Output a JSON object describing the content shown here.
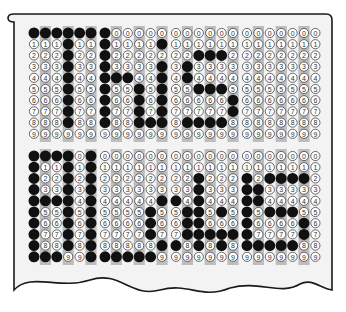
{
  "sheet": {
    "title": "Scantron answer sheet drawing",
    "paper_color": "#f3f3f3",
    "stripe_color": "#bdbdbd",
    "fill_color": "#111111",
    "bubble_stroke": "#444444",
    "groups": [
      6,
      6,
      6,
      7
    ],
    "digits": [
      "0",
      "1",
      "2",
      "3",
      "4",
      "5",
      "6",
      "7",
      "8",
      "9"
    ],
    "blocks": [
      {
        "name": "top",
        "message": "This",
        "filled": [
          [
            0
          ],
          [
            0
          ],
          [
            0
          ],
          [
            0,
            1,
            2,
            3,
            4,
            5,
            6,
            7,
            8
          ],
          [
            0
          ],
          [
            0
          ],
          [
            0,
            1,
            2,
            3,
            4,
            5,
            6,
            7,
            8
          ],
          [
            4
          ],
          [
            4
          ],
          [
            5,
            6,
            7,
            8
          ],
          [
            8
          ],
          [
            1,
            3,
            4,
            5,
            6,
            7,
            8
          ],
          [],
          [
            3,
            4,
            8
          ],
          [
            2,
            5,
            8
          ],
          [
            2,
            5,
            8
          ],
          [
            2,
            5,
            8
          ],
          [
            6,
            7
          ],
          [],
          [],
          [],
          [],
          [],
          [],
          []
        ]
      },
      {
        "name": "bottom",
        "message": "Bold",
        "filled": [
          [
            0,
            1,
            2,
            3,
            4,
            5,
            6,
            7,
            8,
            9
          ],
          [
            0,
            4,
            9
          ],
          [
            0,
            4,
            9
          ],
          [
            0,
            1,
            2,
            3,
            4,
            5,
            6,
            7,
            8
          ],
          [],
          [
            0,
            1,
            2,
            3,
            4,
            5,
            6,
            7,
            8,
            9
          ],
          [
            9
          ],
          [
            9
          ],
          [
            9
          ],
          [
            9
          ],
          [
            5,
            6,
            7,
            9
          ],
          [
            4,
            8
          ],
          [
            4,
            8
          ],
          [
            5,
            6,
            7
          ],
          [
            2,
            3,
            4,
            5,
            6,
            7,
            8
          ],
          [
            7
          ],
          [
            5,
            7,
            8
          ],
          [
            7
          ],
          [
            2,
            3,
            4,
            5,
            6,
            7,
            8
          ],
          [
            3,
            4,
            8
          ],
          [
            2,
            5,
            8
          ],
          [
            2,
            5,
            8
          ],
          [
            2,
            5,
            8
          ],
          [
            2,
            6,
            7
          ],
          []
        ]
      }
    ]
  }
}
